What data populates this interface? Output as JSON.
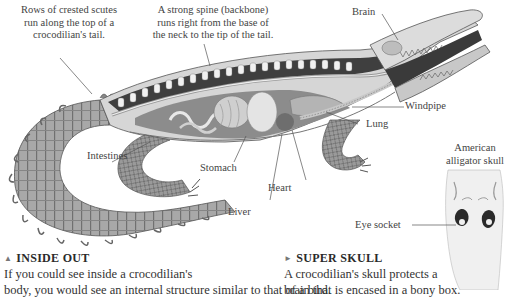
{
  "illustration": {
    "subject": "crocodilian-cutaway",
    "captions": {
      "scutes": [
        "Rows of crested scutes",
        "run along the top of a",
        "crocodilian's tail."
      ],
      "spine": [
        "A strong spine (backbone)",
        "runs right from the base of",
        "the neck to the tip of the tail."
      ]
    },
    "labels": {
      "brain": "Brain",
      "windpipe": "Windpipe",
      "lung": "Lung",
      "intestines": "Intestines",
      "stomach": "Stomach",
      "heart": "Heart",
      "liver": "Liver"
    }
  },
  "skull": {
    "caption": [
      "American",
      "alligator skull"
    ],
    "eye_socket_label": "Eye socket"
  },
  "sections": [
    {
      "marker": "▲",
      "heading": "INSIDE OUT",
      "lines": [
        "If you could see inside a crocodilian's",
        "body, you would see an internal structure similar to that of a bird."
      ]
    },
    {
      "marker": "►",
      "heading": "SUPER SKULL",
      "lines": [
        "A crocodilian's skull protects a",
        "brain that is encased in a bony box."
      ]
    }
  ],
  "colors": {
    "text": "#333333",
    "line": "#555555",
    "body_light": "#d8d8d8",
    "body_dark": "#4a4a4a"
  }
}
